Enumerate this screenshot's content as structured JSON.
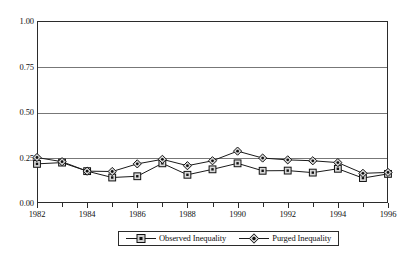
{
  "chart_data": {
    "type": "line",
    "title": "",
    "subtitle": "",
    "xlabel": "",
    "ylabel": "",
    "x": [
      1982,
      1983,
      1984,
      1985,
      1986,
      1987,
      1988,
      1989,
      1990,
      1991,
      1992,
      1993,
      1994,
      1995,
      1996
    ],
    "xlim": [
      1982,
      1996
    ],
    "ylim": [
      0.0,
      1.0
    ],
    "yticks": [
      0.0,
      0.25,
      0.5,
      0.75,
      1.0
    ],
    "ytick_labels": [
      "0.00",
      "0.25",
      "0.50",
      "0.75",
      "1.00"
    ],
    "xticks": [
      1982,
      1983,
      1984,
      1985,
      1986,
      1987,
      1988,
      1989,
      1990,
      1991,
      1992,
      1993,
      1994,
      1995,
      1996
    ],
    "xtick_labels_shown": [
      "1982",
      "1984",
      "1986",
      "1988",
      "1990",
      "1992",
      "1994",
      "1996"
    ],
    "grid": "horizontal",
    "legend_position": "bottom-center",
    "series": [
      {
        "name": "Observed Inequality",
        "marker": "square",
        "color": "#1a1a1a",
        "values": [
          0.215,
          0.222,
          0.175,
          0.14,
          0.147,
          0.218,
          0.155,
          0.185,
          0.218,
          0.177,
          0.178,
          0.167,
          0.188,
          0.137,
          0.16
        ]
      },
      {
        "name": "Purged Inequality",
        "marker": "diamond",
        "color": "#1a1a1a",
        "values": [
          0.25,
          0.227,
          0.175,
          0.173,
          0.215,
          0.24,
          0.205,
          0.232,
          0.285,
          0.247,
          0.237,
          0.232,
          0.222,
          0.163,
          0.168
        ]
      }
    ]
  },
  "legend": {
    "items": [
      {
        "label": "Observed Inequality",
        "marker": "square"
      },
      {
        "label": "Purged Inequality",
        "marker": "diamond"
      }
    ]
  }
}
